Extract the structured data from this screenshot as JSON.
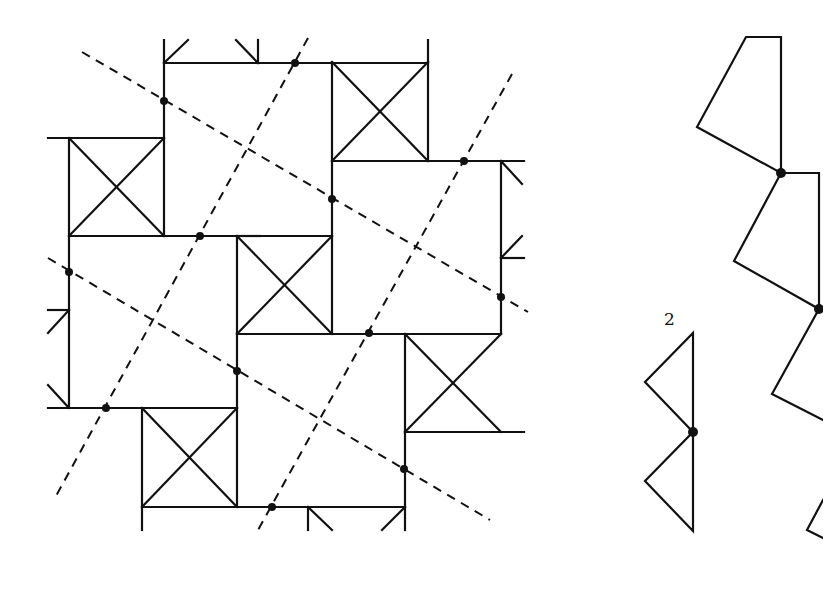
{
  "figure": {
    "type": "tiling-symmetry-diagram",
    "left_panel": {
      "description": "Square tiling with X-marked squares and dashed symmetry axes",
      "x_squares": [
        {
          "x": 332,
          "y": 62,
          "size": 96
        },
        {
          "x": 69,
          "y": 138,
          "size": 94
        },
        {
          "x": 237,
          "y": 236,
          "size": 95
        },
        {
          "x": 405,
          "y": 335,
          "size": 95
        },
        {
          "x": 142,
          "y": 408,
          "size": 96
        }
      ],
      "dashed_lines": [
        {
          "x1": 82,
          "y1": 52,
          "x2": 528,
          "y2": 312
        },
        {
          "x1": 48,
          "y1": 258,
          "x2": 490,
          "y2": 520
        },
        {
          "x1": 308,
          "y1": 38,
          "x2": 56,
          "y2": 496
        },
        {
          "x1": 512,
          "y1": 74,
          "x2": 258,
          "y2": 530
        }
      ],
      "dots": [
        [
          295,
          63
        ],
        [
          164,
          101
        ],
        [
          464,
          161
        ],
        [
          332,
          199
        ],
        [
          200,
          236
        ],
        [
          69,
          272
        ],
        [
          501,
          297
        ],
        [
          369,
          333
        ],
        [
          237,
          371
        ],
        [
          106,
          408
        ],
        [
          404,
          469
        ],
        [
          272,
          507
        ]
      ]
    },
    "right_panel": {
      "label": "2",
      "description": "Chain of quadrilaterals connected at pivot points and a bow-tie of two triangles"
    }
  }
}
